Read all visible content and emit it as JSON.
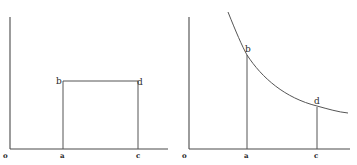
{
  "figure": {
    "left_panel": {
      "description": "Rectangle under a horizontal line between points a and c",
      "labels": {
        "origin": "o",
        "a": "a",
        "c": "c",
        "b": "b",
        "d": "d"
      }
    },
    "right_panel": {
      "description": "Decreasing hyperbola-like curve with verticals at a and c",
      "labels": {
        "origin": "o",
        "a": "a",
        "c": "c",
        "b": "b",
        "d": "d"
      }
    },
    "colors": {
      "ink": "#4a4a4a",
      "background": "#ffffff"
    }
  }
}
